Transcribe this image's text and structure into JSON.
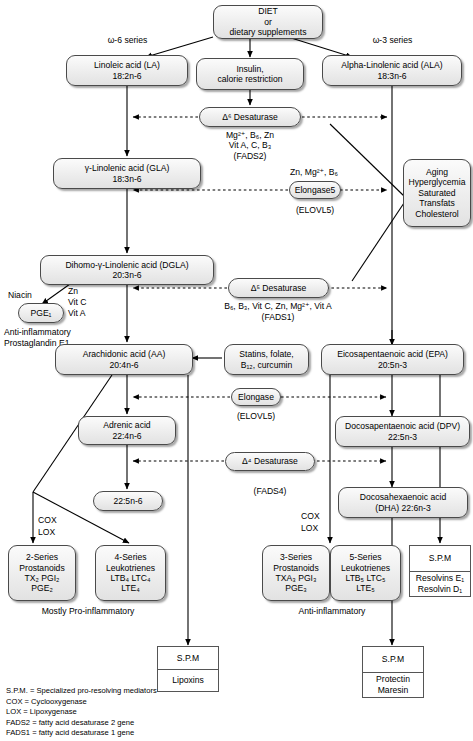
{
  "diagram": {
    "colors": {
      "node_border": "#4a4a4a",
      "node_fill_top": "#fbfbfb",
      "node_fill_bottom": "#e2e2e2",
      "edge": "#000000",
      "page_background": "#ffffff"
    }
  },
  "nodes": {
    "diet": {
      "lines": [
        "DIET",
        "or",
        "dietary supplements"
      ]
    },
    "insulin": {
      "lines": [
        "Insulin,",
        "calorie restriction"
      ]
    },
    "linoleic": {
      "lines": [
        "Linoleic acid (LA)",
        "18:2n-6"
      ]
    },
    "ala": {
      "lines": [
        "Alpha-Linolenic acid (ALA)",
        "18:3n-6"
      ]
    },
    "gla": {
      "lines": [
        "γ-Linolenic acid (GLA)",
        "18:3n-6"
      ]
    },
    "dgla": {
      "lines": [
        "Dihomo-γ-Linolenic acid (DGLA)",
        "20:3n-6"
      ]
    },
    "pge1": {
      "lines": [
        "PGE₁"
      ]
    },
    "aa": {
      "lines": [
        "Arachidonic acid (AA)",
        "20:4n-6"
      ]
    },
    "epa": {
      "lines": [
        "Eicosapentaenoic acid (EPA)",
        "20:5n-3"
      ]
    },
    "adrenic": {
      "lines": [
        "Adrenic acid",
        "22:4n-6"
      ]
    },
    "dpa": {
      "lines": [
        "Docosapentaenoic acid (DPV)",
        "22:5n-3"
      ]
    },
    "n6_22_5": {
      "lines": [
        "22:5n-6"
      ]
    },
    "dha": {
      "lines": [
        "Docosahexaenoic acid",
        "(DHA) 22:6n-3"
      ]
    },
    "statins": {
      "lines": [
        "Statins, folate,",
        "B₁₂, curcumin"
      ]
    },
    "aging": {
      "lines": [
        "Aging",
        "Hyperglycemia",
        "Saturated",
        "Transfats",
        "Cholesterol"
      ]
    }
  },
  "enzymes": {
    "d6": {
      "label": "Δ⁶ Desaturase",
      "cofactors": [
        "Mg²⁺, B₆, Zn",
        "Vit A, C, B₃"
      ],
      "gene": "(FADS2)"
    },
    "elongase5_top": {
      "label": "Elongase5",
      "cofactors": [
        "Zn, Mg²⁺, B₆"
      ],
      "gene": "(ELOVL5)"
    },
    "d5": {
      "label": "Δ⁵ Desaturase",
      "cofactors": [
        "B₆, B₃, Vit C, Zn, Mg²⁺, Vit A"
      ],
      "gene": "(FADS1)"
    },
    "elongase_mid": {
      "label": "Elongase",
      "cofactors": [],
      "gene": "(ELOVL5)"
    },
    "d4": {
      "label": "Δ⁴ Desaturase",
      "cofactors": [],
      "gene": "(FADS4)"
    }
  },
  "products": {
    "prostanoids2": {
      "lines": [
        "2-Series",
        "Prostanoids",
        "TX₂ PGI₂",
        "PGE₂"
      ]
    },
    "leukotrienes4": {
      "lines": [
        "4-Series",
        "Leukotrienes",
        "LTB₄ LTC₄",
        "LTE₄"
      ]
    },
    "prostanoids3": {
      "lines": [
        "3-Series",
        "Prostanoids",
        "TXA₃ PGI₃",
        "PGE₃"
      ]
    },
    "leukotrienes5": {
      "lines": [
        "5-Series",
        "Leukotrienes",
        "LTB₅ LTC₅",
        "LTE₅"
      ]
    },
    "spm_resolvins": {
      "header": "S.P.M",
      "body": [
        "Resolvins E₁",
        "Resolvin D₁"
      ]
    },
    "spm_lipoxins": {
      "header": "S.P.M",
      "body": [
        "Lipoxins"
      ]
    },
    "spm_protectin": {
      "header": "S.P.M",
      "body": [
        "Protectin",
        "Maresin"
      ]
    }
  },
  "labels": {
    "omega6_series": "ω-6 series",
    "omega3_series": "ω-3 series",
    "niacin": "Niacin",
    "dgla_cofactors": [
      "Zn",
      "Vit C",
      "Vit A"
    ],
    "pge1_caption": [
      "Anti-inflammatory",
      "Prostaglandin E1"
    ],
    "cox_lox_left": [
      "COX",
      "LOX"
    ],
    "cox_lox_right": [
      "COX",
      "LOX"
    ],
    "mostly_pro_inflammatory": "Mostly Pro-inflammatory",
    "anti_inflammatory": "Anti-inflammatory"
  },
  "legend": [
    "S.P.M. = Specialized pro-resolving mediators",
    "COX = Cyclooxygenase",
    "LOX = Lipoxygenase",
    "FADS2 = fatty acid desaturase 2 gene",
    "FADS1 = fatty acid desaturase 1 gene"
  ]
}
